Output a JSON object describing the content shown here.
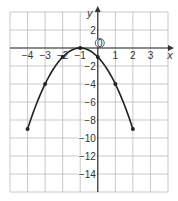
{
  "chart_data": {
    "type": "line",
    "title": "",
    "xlabel": "x",
    "ylabel": "y",
    "xlim": [
      -5,
      4
    ],
    "ylim": [
      -16,
      4
    ],
    "grid": true,
    "x_ticks": [
      -4,
      -3,
      -2,
      -1,
      1,
      2,
      3
    ],
    "y_ticks": [
      2,
      -2,
      -4,
      -6,
      -8,
      -10,
      -12,
      -14
    ],
    "origin_label": "0",
    "series": [
      {
        "name": "y = -(x+1)^2",
        "x": [
          -4,
          -3,
          -2,
          -1,
          0,
          1,
          2
        ],
        "y": [
          -9,
          -4,
          -1,
          0,
          -1,
          -4,
          -9
        ],
        "color": "#222222"
      }
    ]
  },
  "labels": {
    "x_axis": "x",
    "y_axis": "y",
    "origin": "0",
    "x_ticks": [
      "−4",
      "−3",
      "−2",
      "−1",
      "1",
      "2",
      "3"
    ],
    "y_ticks": [
      "2",
      "−2",
      "−4",
      "−6",
      "−8",
      "−10",
      "−12",
      "−14"
    ]
  }
}
